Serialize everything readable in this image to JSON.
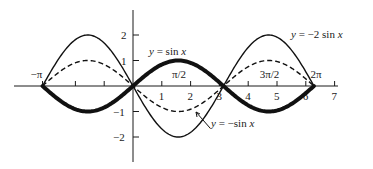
{
  "chart_data": {
    "type": "line",
    "title": "",
    "xlabel": "",
    "ylabel": "",
    "xlim": [
      -3.5,
      7
    ],
    "ylim": [
      -2.6,
      2.6
    ],
    "grid": false,
    "legend": "inline labels",
    "x_ticks": [
      {
        "value": -3.1416,
        "label": "−π"
      },
      {
        "value": -2,
        "label": ""
      },
      {
        "value": -1,
        "label": ""
      },
      {
        "value": 1,
        "label": "1"
      },
      {
        "value": 2,
        "label": "2"
      },
      {
        "value": 3,
        "label": "3"
      },
      {
        "value": 4,
        "label": "4"
      },
      {
        "value": 5,
        "label": "5"
      },
      {
        "value": 6,
        "label": "6"
      },
      {
        "value": 7,
        "label": "7"
      }
    ],
    "x_special_labels": [
      {
        "value": 1.5708,
        "label": "π/2"
      },
      {
        "value": 4.7124,
        "label": "3π/2"
      },
      {
        "value": 6.2832,
        "label": "2π"
      }
    ],
    "y_ticks": [
      {
        "value": 2,
        "label": "2"
      },
      {
        "value": 1,
        "label": "1"
      },
      {
        "value": -1,
        "label": "−1"
      },
      {
        "value": -2,
        "label": "−2"
      }
    ],
    "series": [
      {
        "name": "y = sin x",
        "function": "sin(x)",
        "style": "thick",
        "domain": [
          -3.1416,
          6.2832
        ],
        "amplitude": 1
      },
      {
        "name": "y = −sin x",
        "function": "-sin(x)",
        "style": "dashed",
        "domain": [
          -3.1416,
          6.2832
        ],
        "amplitude": -1
      },
      {
        "name": "y = −2 sin x",
        "function": "-2*sin(x)",
        "style": "thin",
        "domain": [
          -3.1416,
          6.2832
        ],
        "amplitude": -2
      }
    ],
    "annotations": [
      {
        "text": "y = sin x",
        "near": "peak of sin x at π/2"
      },
      {
        "text": "y = −2 sin x",
        "near": "peak of −2 sin x at 3π/2"
      },
      {
        "text": "y = −sin x",
        "near": "trough of −sin x at π/2, with leader arrow"
      }
    ]
  },
  "labels": {
    "sin": {
      "y": "y",
      "eq": " = sin ",
      "x": "x"
    },
    "neg2sin": {
      "y": "y",
      "eq": " = −2 sin ",
      "x": "x"
    },
    "negsin": {
      "y": "y",
      "eq": " = −sin ",
      "x": "x"
    }
  }
}
